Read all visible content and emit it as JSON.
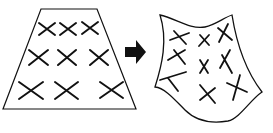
{
  "diagram": {
    "colors": {
      "stroke": "#111111",
      "background": "#ffffff"
    },
    "source_shape": {
      "type": "trapezoid",
      "marks": 9,
      "rows": 3,
      "cols": 3
    },
    "arrow": {
      "direction": "right"
    },
    "target_shape": {
      "type": "warped-sheet",
      "marks": 9
    }
  }
}
